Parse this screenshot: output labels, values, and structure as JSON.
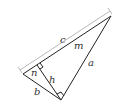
{
  "diagram": {
    "type": "right-triangle-altitude",
    "labels": {
      "c": "c",
      "m": "m",
      "n": "n",
      "h": "h",
      "a": "a",
      "b": "b"
    },
    "colors": {
      "stroke": "#222222",
      "dimension_line": "#999999",
      "label": "#333333"
    }
  }
}
